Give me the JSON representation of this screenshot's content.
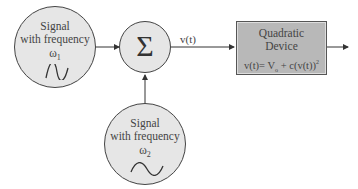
{
  "diagram": {
    "source1": {
      "line1": "Signal",
      "line2": "with frequency",
      "omega": "ω",
      "sub": "1"
    },
    "source2": {
      "line1": "Signal",
      "line2": "with frequency",
      "omega": "ω",
      "sub": "2"
    },
    "summer": {
      "symbol": "Σ"
    },
    "edge_label": "v(t)",
    "device": {
      "line1": "Quadratic",
      "line2": "Device",
      "formula": "v(t)= V",
      "formula_sub": "o",
      "formula_rest": " + c(v(t))",
      "formula_sup": "2"
    }
  }
}
